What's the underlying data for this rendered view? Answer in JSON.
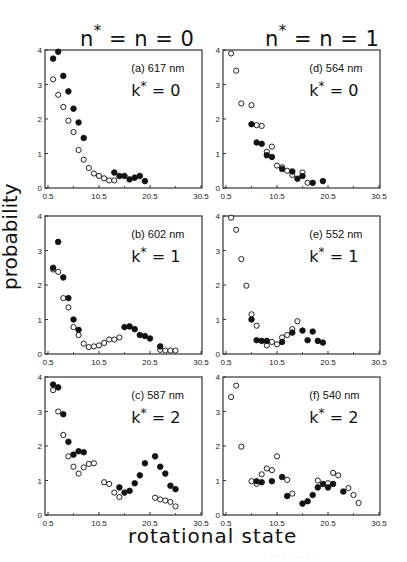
{
  "columns": [
    {
      "title_prefix": "n",
      "title_suffix": " = n = 0"
    },
    {
      "title_prefix": "n",
      "title_suffix": " = n =  1"
    }
  ],
  "ylabel": "probability",
  "xlabel": "rotational state",
  "chart_data": {
    "type": "scatter",
    "layout": "3 rows x 2 columns of scatter panels",
    "column_titles": [
      "n* = n = 0",
      "n* = n = 1"
    ],
    "xlabel": "rotational state",
    "ylabel": "probability",
    "xlim": [
      0.5,
      30.5
    ],
    "ylim": [
      0,
      4
    ],
    "xticks": [
      "0.5",
      "10.5",
      "20.5",
      "30.5"
    ],
    "yticks": [
      "0",
      "1",
      "2",
      "3",
      "4"
    ],
    "grid": false,
    "marker_legend": {
      "filled": "filled circles",
      "open": "open circles"
    },
    "panels": [
      {
        "id": "a",
        "label": "(a)  617 nm",
        "k_label": "k* = 0",
        "wavelength": "617 nm",
        "k": 0,
        "column": 0,
        "row": 0,
        "filled": [
          [
            1,
            3.75
          ],
          [
            2,
            3.95
          ],
          [
            3,
            3.25
          ],
          [
            4,
            2.8
          ],
          [
            5,
            2.3
          ],
          [
            6,
            1.9
          ],
          [
            7,
            1.45
          ],
          [
            13,
            0.45
          ],
          [
            14,
            0.35
          ],
          [
            15,
            0.35
          ],
          [
            16,
            0.25
          ],
          [
            17,
            0.3
          ],
          [
            18,
            0.35
          ],
          [
            19,
            0.2
          ]
        ],
        "open": [
          [
            1,
            3.15
          ],
          [
            2,
            2.7
          ],
          [
            3,
            2.35
          ],
          [
            4,
            1.95
          ],
          [
            5,
            1.62
          ],
          [
            6,
            1.1
          ],
          [
            7,
            0.82
          ],
          [
            8,
            0.58
          ],
          [
            9,
            0.42
          ],
          [
            10,
            0.35
          ],
          [
            11,
            0.28
          ],
          [
            12,
            0.22
          ],
          [
            13,
            0.22
          ]
        ]
      },
      {
        "id": "d",
        "label": "(d) 564 nm",
        "k_label": "k* = 0",
        "wavelength": "564 nm",
        "k": 0,
        "column": 1,
        "row": 0,
        "filled": [
          [
            5,
            1.85
          ],
          [
            6,
            1.32
          ],
          [
            7,
            1.28
          ],
          [
            8,
            0.95
          ],
          [
            9,
            0.9
          ],
          [
            11,
            0.55
          ],
          [
            13,
            0.48
          ],
          [
            14,
            0.27
          ],
          [
            15,
            0.35
          ],
          [
            17,
            0.15
          ],
          [
            19,
            0.2
          ]
        ],
        "open": [
          [
            1,
            3.9
          ],
          [
            2,
            3.4
          ],
          [
            3,
            2.45
          ],
          [
            5,
            2.4
          ],
          [
            6,
            1.82
          ],
          [
            7,
            1.8
          ],
          [
            8,
            1.05
          ],
          [
            9,
            1.2
          ],
          [
            10,
            0.65
          ],
          [
            11,
            0.6
          ],
          [
            12,
            0.5
          ],
          [
            13,
            0.38
          ],
          [
            15,
            0.45
          ],
          [
            16,
            0.15
          ]
        ]
      },
      {
        "id": "b",
        "label": "(b) 602 nm",
        "k_label": "k* = 1",
        "wavelength": "602 nm",
        "k": 1,
        "column": 0,
        "row": 1,
        "filled": [
          [
            1,
            2.5
          ],
          [
            2,
            3.25
          ],
          [
            3,
            2.22
          ],
          [
            4,
            1.62
          ],
          [
            5,
            1.0
          ],
          [
            6,
            0.7
          ],
          [
            15,
            0.78
          ],
          [
            16,
            0.8
          ],
          [
            17,
            0.72
          ],
          [
            18,
            0.55
          ],
          [
            19,
            0.52
          ],
          [
            20,
            0.45
          ],
          [
            22,
            0.22
          ]
        ],
        "open": [
          [
            1,
            2.45
          ],
          [
            2,
            2.38
          ],
          [
            3,
            1.62
          ],
          [
            4,
            1.35
          ],
          [
            5,
            0.78
          ],
          [
            6,
            0.55
          ],
          [
            7,
            0.3
          ],
          [
            8,
            0.2
          ],
          [
            9,
            0.22
          ],
          [
            10,
            0.25
          ],
          [
            11,
            0.32
          ],
          [
            12,
            0.42
          ],
          [
            13,
            0.42
          ],
          [
            14,
            0.48
          ],
          [
            22,
            0.12
          ],
          [
            23,
            0.1
          ],
          [
            24,
            0.1
          ],
          [
            25,
            0.1
          ]
        ]
      },
      {
        "id": "e",
        "label": "(e) 552 nm",
        "k_label": "k* = 1",
        "wavelength": "552 nm",
        "k": 1,
        "column": 1,
        "row": 1,
        "filled": [
          [
            5,
            1.0
          ],
          [
            6,
            0.4
          ],
          [
            7,
            0.38
          ],
          [
            8,
            0.38
          ],
          [
            11,
            0.35
          ],
          [
            13,
            0.62
          ],
          [
            15,
            0.68
          ],
          [
            16,
            0.4
          ],
          [
            17,
            0.65
          ],
          [
            18,
            0.38
          ],
          [
            19,
            0.33
          ]
        ],
        "open": [
          [
            1,
            3.95
          ],
          [
            2,
            3.6
          ],
          [
            3,
            2.75
          ],
          [
            4,
            1.98
          ],
          [
            5,
            1.15
          ],
          [
            6,
            0.82
          ],
          [
            8,
            0.25
          ],
          [
            9,
            0.35
          ],
          [
            10,
            0.28
          ],
          [
            11,
            0.48
          ],
          [
            12,
            0.55
          ],
          [
            13,
            0.72
          ],
          [
            14,
            0.95
          ]
        ]
      },
      {
        "id": "c",
        "label": "(c)  587 nm",
        "k_label": "k* = 2",
        "wavelength": "587 nm",
        "k": 2,
        "column": 0,
        "row": 2,
        "filled": [
          [
            1,
            3.78
          ],
          [
            2,
            3.7
          ],
          [
            3,
            2.92
          ],
          [
            4,
            2.12
          ],
          [
            5,
            1.75
          ],
          [
            6,
            1.85
          ],
          [
            7,
            1.82
          ],
          [
            14,
            0.8
          ],
          [
            15,
            0.65
          ],
          [
            16,
            0.7
          ],
          [
            17,
            0.92
          ],
          [
            18,
            1.15
          ],
          [
            19,
            1.5
          ],
          [
            21,
            1.7
          ],
          [
            22,
            1.4
          ],
          [
            23,
            1.2
          ],
          [
            24,
            0.85
          ],
          [
            25,
            0.75
          ]
        ],
        "open": [
          [
            1,
            3.62
          ],
          [
            2,
            3.0
          ],
          [
            3,
            2.32
          ],
          [
            4,
            1.7
          ],
          [
            5,
            1.4
          ],
          [
            6,
            1.2
          ],
          [
            7,
            1.38
          ],
          [
            8,
            1.48
          ],
          [
            9,
            1.5
          ],
          [
            11,
            0.95
          ],
          [
            12,
            0.9
          ],
          [
            13,
            0.65
          ],
          [
            14,
            0.52
          ],
          [
            21,
            0.5
          ],
          [
            22,
            0.45
          ],
          [
            23,
            0.42
          ],
          [
            24,
            0.38
          ],
          [
            25,
            0.25
          ]
        ]
      },
      {
        "id": "f",
        "label": "(f)  540 nm",
        "k_label": "k* = 2",
        "wavelength": "540 nm",
        "k": 2,
        "column": 1,
        "row": 2,
        "filled": [
          [
            6,
            0.98
          ],
          [
            7,
            0.95
          ],
          [
            9,
            0.98
          ],
          [
            11,
            1.1
          ],
          [
            12,
            0.55
          ],
          [
            15,
            0.33
          ],
          [
            16,
            0.4
          ],
          [
            17,
            0.58
          ],
          [
            18,
            0.8
          ],
          [
            19,
            0.9
          ],
          [
            20,
            0.8
          ],
          [
            21,
            0.9
          ],
          [
            23,
            0.68
          ]
        ],
        "open": [
          [
            1,
            3.42
          ],
          [
            2,
            3.75
          ],
          [
            3,
            1.98
          ],
          [
            5,
            0.98
          ],
          [
            6,
            0.9
          ],
          [
            7,
            1.18
          ],
          [
            8,
            1.35
          ],
          [
            9,
            1.3
          ],
          [
            10,
            1.7
          ],
          [
            12,
            1.02
          ],
          [
            13,
            0.62
          ],
          [
            18,
            1.0
          ],
          [
            20,
            0.92
          ],
          [
            21,
            1.22
          ],
          [
            22,
            1.15
          ],
          [
            24,
            0.78
          ],
          [
            25,
            0.58
          ],
          [
            26,
            0.35
          ]
        ]
      }
    ]
  },
  "footer_text": "· · ·  . . .  . ."
}
